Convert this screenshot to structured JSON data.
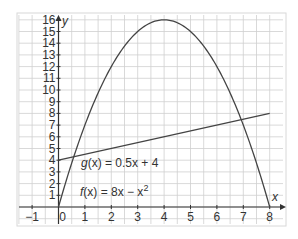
{
  "chart_data": {
    "type": "line",
    "title": "",
    "xlabel": "x",
    "ylabel": "y",
    "xlim": [
      -1.5,
      8.4
    ],
    "ylim": [
      -0.7,
      16
    ],
    "grid": true,
    "legend": "inline annotations",
    "x_ticks": [
      "-1",
      "0",
      "1",
      "2",
      "3",
      "4",
      "5",
      "6",
      "7",
      "8"
    ],
    "y_ticks": [
      "1",
      "2",
      "3",
      "4",
      "5",
      "6",
      "7",
      "8",
      "9",
      "10",
      "11",
      "12",
      "13",
      "14",
      "15",
      "16"
    ],
    "series": [
      {
        "name": "f(x) = 8x − x²",
        "expression": "8x - x^2",
        "x": [
          0,
          0.5,
          1,
          2,
          3,
          4,
          5,
          6,
          7,
          8
        ],
        "values": [
          0,
          3.75,
          7,
          12,
          15,
          16,
          15,
          12,
          7,
          0
        ]
      },
      {
        "name": "g(x) = 0.5x + 4",
        "expression": "0.5x + 4",
        "x": [
          0,
          8
        ],
        "values": [
          4,
          8
        ]
      }
    ],
    "annotations": [
      {
        "text_pre": "g(x) = 0.5x + 4",
        "at": [
          1.2,
          3.5
        ]
      },
      {
        "text_pre": "f(x) = 8x − x",
        "sup": "2",
        "at": [
          1.2,
          1.0
        ]
      }
    ]
  },
  "labels": {
    "x_axis": "x",
    "y_axis": "y",
    "g_func": "g",
    "g_rest": "(x) = 0.5x + 4",
    "f_func": "f",
    "f_rest": "(x) = 8x − x",
    "f_sup": "2"
  },
  "colors": {
    "curve": "#444444",
    "grid": "#cfcfcf",
    "axis": "#333333",
    "frame": "#d8d8d8"
  }
}
